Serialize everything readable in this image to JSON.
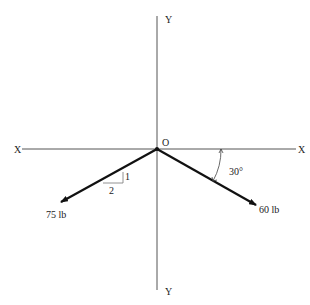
{
  "diagram": {
    "type": "force-vector-diagram",
    "axes": {
      "y_top_label": "Y",
      "y_bottom_label": "Y",
      "x_left_label": "X",
      "x_right_label": "X",
      "origin_label": "O"
    },
    "forces": [
      {
        "name": "left-force",
        "magnitude_label": "75 lb",
        "slope_rise": "1",
        "slope_run": "2",
        "direction": "down-left"
      },
      {
        "name": "right-force",
        "magnitude_label": "60 lb",
        "angle_label": "30°",
        "direction": "down-right"
      }
    ],
    "colors": {
      "axis": "#555555",
      "vector": "#111111",
      "text": "#222222"
    }
  }
}
